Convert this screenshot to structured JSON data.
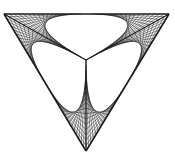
{
  "diagram": {
    "type": "string-art",
    "vertices": {
      "top_left": [
        4,
        14
      ],
      "top_right": [
        169,
        14
      ],
      "bottom": [
        86,
        151
      ],
      "center": [
        86,
        60
      ]
    },
    "lines_per_envelope": 16,
    "stroke_color": "#1a1a1a",
    "background": "#ffffff"
  }
}
